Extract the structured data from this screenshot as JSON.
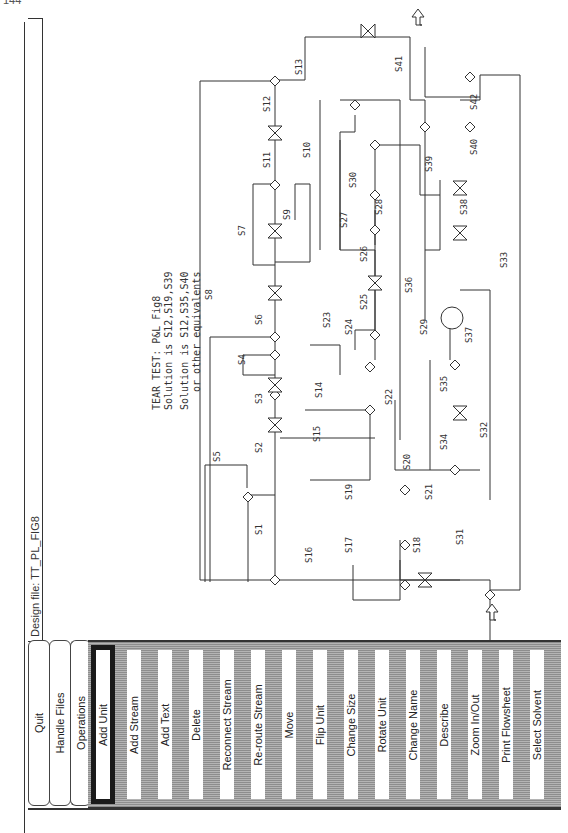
{
  "page_number": "144",
  "design_file": {
    "label": "Design file:",
    "name": "TT_PL_FIG8",
    "text": "Design file:  TT_PL_FIG8"
  },
  "menu": {
    "tabs": [
      {
        "label": "Quit"
      },
      {
        "label": "Handle Files"
      },
      {
        "label": "Operations"
      }
    ],
    "commands": [
      {
        "label": "Add Unit",
        "selected": true
      },
      {
        "label": "Add Stream"
      },
      {
        "label": "Add Text"
      },
      {
        "label": "Delete"
      },
      {
        "label": "Reconnect Stream"
      },
      {
        "label": "Re-route Stream"
      },
      {
        "label": "Move"
      },
      {
        "label": "Flip Unit"
      },
      {
        "label": "Change Size"
      },
      {
        "label": "Rotate Unit"
      },
      {
        "label": "Change Name"
      },
      {
        "label": "Describe"
      },
      {
        "label": "Zoom In/Out"
      },
      {
        "label": "Print Flowsheet"
      },
      {
        "label": "Select Solvent"
      }
    ]
  },
  "canvas": {
    "annotation": {
      "line1": "TEAR TEST: P&L Fig8",
      "line2": "Solution is S12,S19,S39",
      "line3": "Solution is S12,S35,S40",
      "line4": "or other equivalents"
    },
    "stream_labels": {
      "S1": "S1",
      "S2": "S2",
      "S3": "S3",
      "S4": "S4",
      "S5": "S5",
      "S6": "S6",
      "S7": "S7",
      "S8": "S8",
      "S9": "S9",
      "S10": "S10",
      "S11": "S11",
      "S12": "S12",
      "S13": "S13",
      "S14": "S14",
      "S15": "S15",
      "S16": "S16",
      "S17": "S17",
      "S18": "S18",
      "S19": "S19",
      "S20": "S20",
      "S21": "S21",
      "S22": "S22",
      "S23": "S23",
      "S24": "S24",
      "S25": "S25",
      "S26": "S26",
      "S27": "S27",
      "S28": "S28",
      "S29": "S29",
      "S30": "S30",
      "S31": "S31",
      "S32": "S32",
      "S33": "S33",
      "S34": "S34",
      "S35": "S35",
      "S36": "S36",
      "S37": "S37",
      "S38": "S38",
      "S39": "S39",
      "S40": "S40",
      "S41": "S41",
      "S42": "S42"
    },
    "colors": {
      "line": "#333333",
      "panel_dark": "#8d8d8d",
      "panel_light": "#b4b4b4"
    }
  }
}
